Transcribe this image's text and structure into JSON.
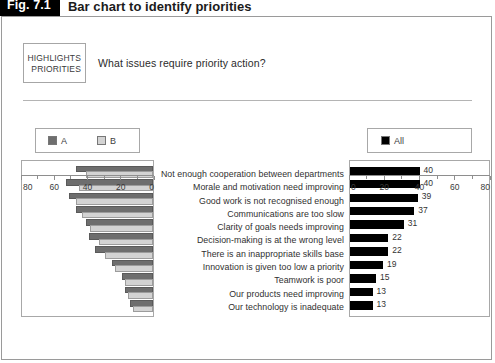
{
  "figure": {
    "tag": "Fig. 7.1",
    "title": "Bar chart to identify priorities"
  },
  "callout": {
    "line1": "HIGHLIGHTS",
    "line2": "PRIORITIES"
  },
  "question": "What issues require priority action?",
  "legend_left": {
    "items": [
      {
        "label": "A",
        "color": "#6e6e6e"
      },
      {
        "label": "B",
        "color": "#d3d3d3"
      }
    ]
  },
  "legend_right": {
    "items": [
      {
        "label": "All",
        "color": "#000000"
      }
    ]
  },
  "chart_data": {
    "type": "bar",
    "title": "Bar chart to identify priorities",
    "subtitle": "What issues require priority action?",
    "orientation": "horizontal",
    "grid": false,
    "categories": [
      "Not enough cooperation between departments",
      "Morale and motivation need improving",
      "Good work is not recognised enough",
      "Communications are too slow",
      "Clarity of goals needs improving",
      "Decision-making is at the wrong level",
      "There is an inappropriate skills base",
      "Innovation is given too low a priority",
      "Teamwork is poor",
      "Our products need improving",
      "Our technology is inadequate"
    ],
    "panels": [
      {
        "name": "left-panel",
        "axis_direction": "reversed",
        "xlim": [
          0,
          80
        ],
        "ticks": [
          80,
          60,
          40,
          20,
          0
        ],
        "series": [
          {
            "name": "A",
            "color": "#6e6e6e",
            "values": [
              46,
              52,
              50,
              46,
              40,
              38,
              34,
              24,
              18,
              16,
              13
            ]
          },
          {
            "name": "B",
            "color": "#d3d3d3",
            "values": [
              40,
              44,
              46,
              42,
              37,
              32,
              28,
              22,
              16,
              14,
              11
            ]
          }
        ]
      },
      {
        "name": "right-panel",
        "axis_direction": "normal",
        "xlim": [
          0,
          80
        ],
        "ticks": [
          0,
          20,
          40,
          60,
          80
        ],
        "series": [
          {
            "name": "All",
            "color": "#000000",
            "values": [
              40,
              40,
              39,
              37,
              31,
              22,
              22,
              19,
              15,
              13,
              13
            ]
          }
        ]
      }
    ]
  }
}
